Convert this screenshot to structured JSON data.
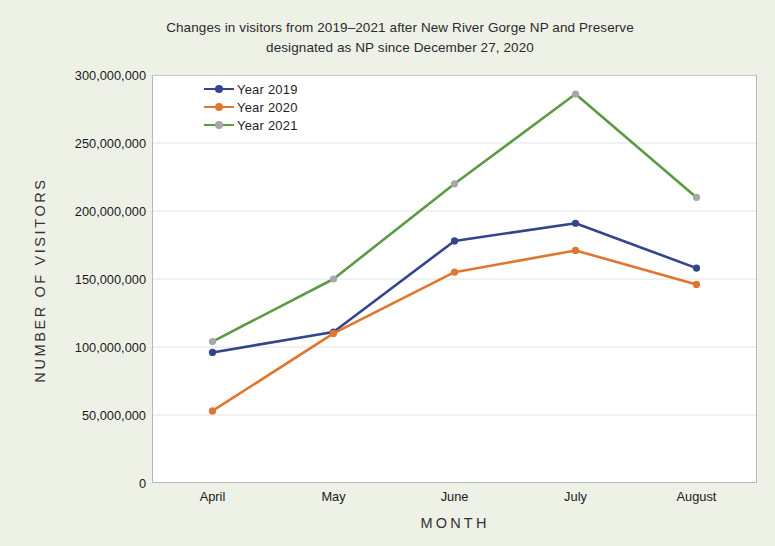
{
  "chart_data": {
    "type": "line",
    "title": "Changes in visitors from 2019–2021 after New River Gorge NP and Preserve designated as NP since December 27, 2020",
    "title_line1": "Changes in visitors from 2019–2021 after New River Gorge NP and Preserve",
    "title_line2": "designated as NP since December 27, 2020",
    "xlabel": "MONTH",
    "ylabel": "NUMBER OF VISITORS",
    "categories": [
      "April",
      "May",
      "June",
      "July",
      "August"
    ],
    "ylim": [
      0,
      300000000
    ],
    "ytick_values": [
      0,
      50000000,
      100000000,
      150000000,
      200000000,
      250000000,
      300000000
    ],
    "ytick_labels": [
      "0",
      "50,000,000",
      "100,000,000",
      "150,000,000",
      "200,000,000",
      "250,000,000",
      "300,000,000"
    ],
    "grid": true,
    "legend_position": "upper-left-inside",
    "series": [
      {
        "name": "Year 2019",
        "color": "#33458c",
        "marker_color": "#33458c",
        "values": [
          96000000,
          111000000,
          178000000,
          191000000,
          158000000
        ]
      },
      {
        "name": "Year 2020",
        "color": "#e0762e",
        "marker_color": "#e0762e",
        "values": [
          53000000,
          110000000,
          155000000,
          171000000,
          146000000
        ]
      },
      {
        "name": "Year 2021",
        "color": "#5b9b43",
        "marker_color": "#a8a8a8",
        "values": [
          104000000,
          150000000,
          220000000,
          286000000,
          210000000
        ]
      }
    ]
  },
  "colors": {
    "background": "#eef1e6",
    "plot_background": "#ffffff",
    "plot_border": "#b7b7b7",
    "gridline": "#e2e2e2",
    "series_2019": "#33458c",
    "series_2020": "#e0762e",
    "series_2021": "#5b9b43"
  }
}
